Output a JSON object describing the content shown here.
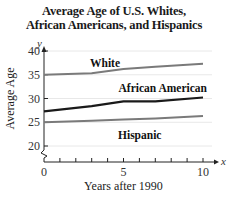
{
  "title_lines": [
    "Average Age of U.S. Whites,",
    "African Americans, and Hispanics"
  ],
  "chart_data": {
    "type": "line",
    "title": "Average Age of U.S. Whites, African Americans, and Hispanics",
    "xlabel": "Years after 1990",
    "ylabel": "Average Age",
    "x_axis_var": "x",
    "y_axis_var": "y",
    "xlim": [
      0,
      10
    ],
    "ylim": [
      20,
      40
    ],
    "xticks": [
      0,
      5,
      10
    ],
    "x_minor_ticks": [
      1,
      2,
      3,
      4,
      6,
      7,
      8,
      9
    ],
    "yticks": [
      20,
      25,
      30,
      35,
      40
    ],
    "y_axis_break": true,
    "grid": "horizontal",
    "legend": "inline labels",
    "x": [
      0,
      3,
      5,
      7,
      10
    ],
    "series": [
      {
        "name": "White",
        "values": [
          35.0,
          35.3,
          36.2,
          36.7,
          37.3
        ],
        "color": "#7a7a7a"
      },
      {
        "name": "African American",
        "values": [
          27.3,
          28.4,
          29.4,
          29.4,
          30.2
        ],
        "color": "#1a1a1a"
      },
      {
        "name": "Hispanic",
        "values": [
          25.0,
          25.3,
          25.6,
          25.8,
          26.3
        ],
        "color": "#7a7a7a"
      }
    ]
  }
}
